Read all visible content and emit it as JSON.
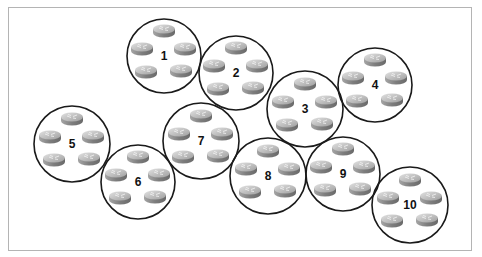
{
  "diagram": {
    "type": "network-clusters",
    "routers_per_cluster": 5,
    "colors": {
      "frame": "#b4b4b4",
      "circle_stroke": "#1a1a1a",
      "router_top": "#c8c8c8",
      "router_side": "#8c8c8c",
      "label": "#111111"
    },
    "clusters": [
      {
        "label": "1",
        "cx": 164,
        "cy": 56,
        "r": 37
      },
      {
        "label": "2",
        "cx": 236,
        "cy": 73,
        "r": 37
      },
      {
        "label": "3",
        "cx": 305,
        "cy": 109,
        "r": 38
      },
      {
        "label": "4",
        "cx": 375,
        "cy": 85,
        "r": 37
      },
      {
        "label": "5",
        "cx": 72,
        "cy": 144,
        "r": 38
      },
      {
        "label": "6",
        "cx": 138,
        "cy": 182,
        "r": 37
      },
      {
        "label": "7",
        "cx": 201,
        "cy": 141,
        "r": 38
      },
      {
        "label": "8",
        "cx": 268,
        "cy": 176,
        "r": 38
      },
      {
        "label": "9",
        "cx": 343,
        "cy": 174,
        "r": 37
      },
      {
        "label": "10",
        "cx": 410,
        "cy": 205,
        "r": 38
      }
    ],
    "router_offsets": [
      {
        "dx": 0,
        "dy": -26
      },
      {
        "dx": -22,
        "dy": -8
      },
      {
        "dx": 21,
        "dy": -8
      },
      {
        "dx": -18,
        "dy": 15
      },
      {
        "dx": 17,
        "dy": 14
      }
    ]
  }
}
